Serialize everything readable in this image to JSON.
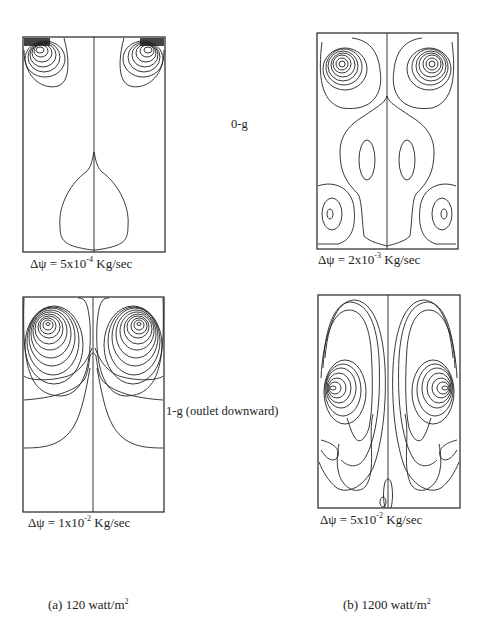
{
  "figure": {
    "row_labels": {
      "row1": "0-g",
      "row2": "1-g (outlet downward)"
    },
    "column_labels": {
      "a": {
        "prefix": "(a) 120 watt/m",
        "sup": "2"
      },
      "b": {
        "prefix": "(b) 1200 watt/m",
        "sup": "2"
      }
    },
    "panels": [
      {
        "id": "a-0g",
        "caption_base": "Δψ = 5x10",
        "caption_exp": "-4",
        "caption_unit": " Kg/sec"
      },
      {
        "id": "b-0g",
        "caption_base": "Δψ = 2x10",
        "caption_exp": "-3",
        "caption_unit": " Kg/sec"
      },
      {
        "id": "a-1g",
        "caption_base": "Δψ = 1x10",
        "caption_exp": "-2",
        "caption_unit": " Kg/sec"
      },
      {
        "id": "b-1g",
        "caption_base": "Δψ = 5x10",
        "caption_exp": "-2",
        "caption_unit": " Kg/sec"
      }
    ]
  }
}
